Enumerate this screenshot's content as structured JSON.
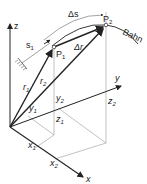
{
  "diagram": {
    "axes": {
      "z": "z",
      "y": "y",
      "x": "x"
    },
    "points": {
      "p1": "P",
      "p1_sub": "1",
      "p2": "P",
      "p2_sub": "2"
    },
    "path_label": "Bahn",
    "arc_length": "Δs",
    "s1": "s",
    "s1_sub": "1",
    "vectors": {
      "r1": "r",
      "r1_sub": "1",
      "r2": "r",
      "r2_sub": "2",
      "delta_r": "Δr"
    },
    "coordinates": {
      "x1": "x",
      "x1_sub": "1",
      "x2": "x",
      "x2_sub": "2",
      "y1": "y",
      "y1_sub": "1",
      "y2": "y",
      "y2_sub": "2",
      "z1": "z",
      "z1_sub": "1",
      "z2": "z",
      "z2_sub": "2"
    },
    "colors": {
      "line": "#222222",
      "thin": "#888888"
    }
  }
}
